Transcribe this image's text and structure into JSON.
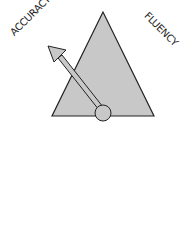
{
  "labels": {
    "left": "ACCURACY",
    "right": "FLUENCY"
  },
  "colors": {
    "fill": "#c8c8c8",
    "stroke": "#222222"
  }
}
